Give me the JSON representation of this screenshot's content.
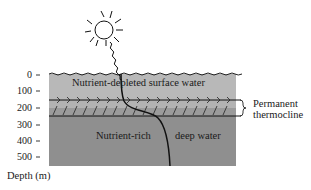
{
  "diagram": {
    "layers": [
      {
        "name": "surface",
        "label": "Nutrient-depleted surface water",
        "color": "#b8b8b8"
      },
      {
        "name": "thermocline-upper",
        "color": "#b3b3b3"
      },
      {
        "name": "thermocline-lower",
        "color": "#9b9b9b"
      },
      {
        "name": "deep",
        "label_left": "Nutrient-rich",
        "label_right": "deep water",
        "color": "#8f8f8f"
      }
    ],
    "thermocline_label_line1": "Permanent",
    "thermocline_label_line2": "thermocline",
    "axis": {
      "label": "Depth (m)",
      "ticks": [
        "0",
        "100",
        "200",
        "300",
        "400",
        "500"
      ]
    },
    "icons": {
      "sun": "sun-icon",
      "light-ray": "wavy-ray-icon"
    }
  }
}
